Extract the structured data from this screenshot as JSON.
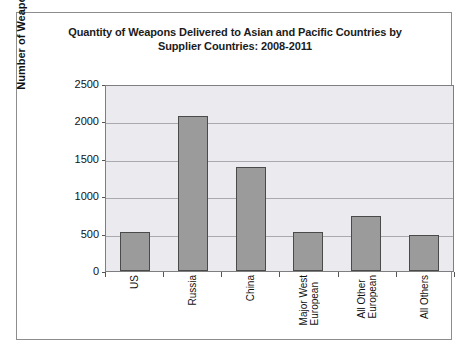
{
  "chart_data": {
    "type": "bar",
    "title": "Quantity of Weapons Delivered to Asian and Pacific Countries by Supplier Countries: 2008-2011",
    "title_line1": "Quantity of Weapons Delivered to Asian and Pacific Countries by",
    "title_line2": "Supplier Countries: 2008-2011",
    "categories": [
      "US",
      "Russia",
      "China",
      "Major West\nEuropean",
      "All Other\nEuropean",
      "All Others"
    ],
    "values": [
      530,
      2100,
      1400,
      530,
      750,
      480
    ],
    "xlabel": "",
    "ylabel": "Number of Weapons Delivered",
    "ylim": [
      0,
      2500
    ],
    "ytick_labels": [
      "2500",
      "2000",
      "1500",
      "1000",
      "500",
      "0"
    ],
    "ytick_values": [
      2500,
      2000,
      1500,
      1000,
      500,
      0
    ],
    "grid": true,
    "legend": false,
    "bar_color": "#9b9b9b",
    "bar_border_color": "#4a4a4a",
    "plot_background": "#eaeaef",
    "gridline_color": "#a9a9b0",
    "frame_border_color": "#8d8d8d"
  }
}
